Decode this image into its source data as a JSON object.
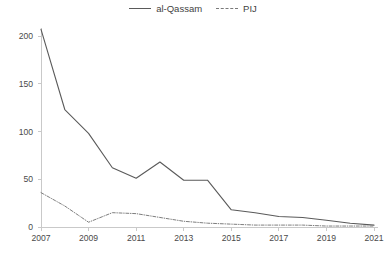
{
  "chart_data": {
    "type": "line",
    "title": "",
    "subtitle": "",
    "xlabel": "",
    "ylabel": "",
    "x": [
      2007,
      2008,
      2009,
      2010,
      2011,
      2012,
      2013,
      2014,
      2015,
      2016,
      2017,
      2018,
      2019,
      2020,
      2021
    ],
    "xlim": [
      2007,
      2021
    ],
    "ylim": [
      0,
      200
    ],
    "yticks": [
      0,
      50,
      100,
      150,
      200
    ],
    "ytick_labels": [
      "0",
      "50",
      "100",
      "150",
      "200"
    ],
    "xticks": [
      2007,
      2009,
      2011,
      2013,
      2015,
      2017,
      2019,
      2021
    ],
    "xtick_labels": [
      "2007",
      "2009",
      "2011",
      "2013",
      "2015",
      "2017",
      "2019",
      "2021"
    ],
    "grid": false,
    "legend_position": "top-center",
    "series": [
      {
        "name": "al-Qassam",
        "style": "solid",
        "color": "#5a5a5a",
        "values": [
          207,
          123,
          98,
          62,
          51,
          68,
          49,
          49,
          18,
          15,
          11,
          10,
          7,
          4,
          2
        ]
      },
      {
        "name": "PIJ",
        "style": "dash-dot",
        "color": "#7e7e7e",
        "values": [
          36,
          22,
          5,
          15,
          14,
          10,
          6,
          4,
          3,
          2,
          2,
          2,
          1,
          1,
          1
        ]
      }
    ]
  },
  "legend": {
    "entries": [
      {
        "label": "al-Qassam",
        "style": "solid"
      },
      {
        "label": "PIJ",
        "style": "dash-dot"
      }
    ]
  }
}
